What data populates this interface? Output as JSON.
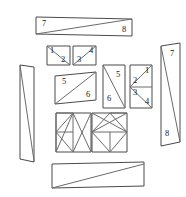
{
  "figure": {
    "canvas": {
      "width": 186,
      "height": 197
    },
    "colors": {
      "background": "#ffffff",
      "outline": "#4a4a4a",
      "cut_line": "#6b6b6b",
      "label_text": "#1a1a1a"
    },
    "pieces": [
      {
        "id": "top-bar",
        "name": "top-horizontal-bar",
        "kind": "rectangle-with-diagonal",
        "outline": "36,17 132,19 132,36 36,34",
        "cuts": [
          "36,34 132,19"
        ],
        "labels": [
          {
            "text": "7",
            "x": 44,
            "y": 24
          },
          {
            "text": "8",
            "x": 124,
            "y": 30
          }
        ]
      },
      {
        "id": "small-square-left",
        "name": "small-square-pieces-1-2",
        "kind": "square-with-diagonal",
        "outline": "47,46 70,46 70,65 47,65",
        "cuts": [
          "47,46 70,65"
        ],
        "labels": [
          {
            "text": "1",
            "x": 52,
            "y": 51
          },
          {
            "text": "2",
            "x": 63,
            "y": 60
          }
        ]
      },
      {
        "id": "small-square-right",
        "name": "small-square-pieces-3-4",
        "kind": "square-with-diagonal",
        "outline": "73,46 96,46 96,65 73,65",
        "cuts": [
          "73,65 96,46"
        ],
        "labels": [
          {
            "text": "4",
            "x": 91,
            "y": 51
          },
          {
            "text": "3",
            "x": 79,
            "y": 60
          }
        ]
      },
      {
        "id": "parallelogram-mid",
        "name": "parallelogram-pieces-5-6",
        "kind": "parallelogram-with-diagonal",
        "outline": "55,76 96,72 96,100 55,104",
        "cuts": [
          "55,104 96,72"
        ],
        "labels": [
          {
            "text": "5",
            "x": 64,
            "y": 82
          },
          {
            "text": "6",
            "x": 88,
            "y": 95
          }
        ]
      },
      {
        "id": "tall-rect-mid",
        "name": "tall-rectangle-pieces-5-6",
        "kind": "rectangle-with-diagonal",
        "outline": "103,65 125,65 125,108 103,108",
        "cuts": [
          "103,65 125,108"
        ],
        "labels": [
          {
            "text": "5",
            "x": 118,
            "y": 75
          },
          {
            "text": "6",
            "x": 109,
            "y": 99
          }
        ]
      },
      {
        "id": "tall-rect-right",
        "name": "tall-rectangle-pieces-1-2-3-4",
        "kind": "rectangle-split-two-cells",
        "outline": "130,65 152,65 152,108 130,108",
        "cuts": [
          "130,87 152,87",
          "130,87 152,65",
          "130,87 152,108"
        ],
        "labels": [
          {
            "text": "1",
            "x": 147,
            "y": 71
          },
          {
            "text": "2",
            "x": 135,
            "y": 81
          },
          {
            "text": "3",
            "x": 135,
            "y": 93
          },
          {
            "text": "4",
            "x": 147,
            "y": 102
          }
        ]
      },
      {
        "id": "right-bar",
        "name": "right-vertical-bar",
        "kind": "parallelogram-with-diagonal",
        "outline": "161,46 180,43 180,142 161,146",
        "cuts": [
          "161,46 180,142"
        ],
        "labels": [
          {
            "text": "7",
            "x": 172,
            "y": 54
          },
          {
            "text": "8",
            "x": 167,
            "y": 134
          }
        ]
      },
      {
        "id": "left-bar",
        "name": "left-vertical-bar",
        "kind": "parallelogram-with-diagonal",
        "outline": "20,65 34,67 34,162 20,159",
        "cuts": [
          "20,65 34,161"
        ],
        "labels": []
      },
      {
        "id": "grid-panel-left",
        "name": "triangle-panel-left",
        "kind": "square-triangulated",
        "outline": "56,113 91,113 91,152 56,152",
        "cuts": [
          "56,113 73,113",
          "56,132 73,132",
          "56,113 56,152",
          "73,113 56,132",
          "73,113 56,152",
          "56,132 73,152",
          "73,113 73,152",
          "73,113 91,152",
          "73,152 91,113"
        ],
        "labels": []
      },
      {
        "id": "grid-panel-right",
        "name": "triangle-panel-right",
        "kind": "square-triangulated",
        "outline": "92,113 127,113 127,152 92,152",
        "cuts": [
          "92,132 127,132",
          "92,132 110,113",
          "92,132 110,152",
          "110,113 127,113",
          "110,113 127,132",
          "110,132 110,152",
          "92,113 127,132",
          "110,152 127,132",
          "92,132 127,113"
        ],
        "labels": []
      },
      {
        "id": "bottom-bar",
        "name": "bottom-horizontal-bar",
        "kind": "rectangle-with-diagonal",
        "outline": "52,164 144,162 144,186 52,188",
        "cuts": [
          "52,188 144,164"
        ],
        "labels": []
      }
    ]
  }
}
